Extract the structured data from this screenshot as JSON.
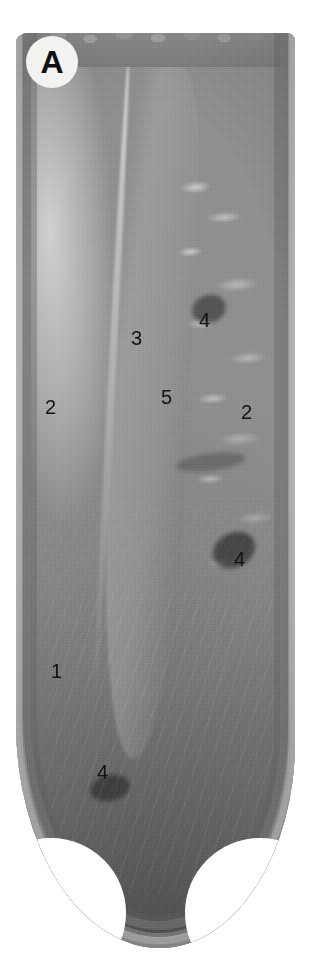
{
  "figure": {
    "panel_label": "A",
    "caption_text": "",
    "background_color": "#ffffff",
    "label_color": "#121212",
    "badge_color": "#f2f2f0"
  },
  "annotations": [
    {
      "id": "label-3-septum",
      "text": "3",
      "x": 131,
      "y": 328
    },
    {
      "id": "label-4-upper-crypt",
      "text": "4",
      "x": 199,
      "y": 310
    },
    {
      "id": "label-2-left-wall",
      "text": "2",
      "x": 45,
      "y": 397
    },
    {
      "id": "label-5-midzone",
      "text": "5",
      "x": 161,
      "y": 387
    },
    {
      "id": "label-2-right-wall",
      "text": "2",
      "x": 241,
      "y": 402
    },
    {
      "id": "label-4-middle-crypt",
      "text": "4",
      "x": 234,
      "y": 549
    },
    {
      "id": "label-1-chamber",
      "text": "1",
      "x": 51,
      "y": 661
    },
    {
      "id": "label-4-lower-crypt",
      "text": "4",
      "x": 97,
      "y": 762
    }
  ]
}
